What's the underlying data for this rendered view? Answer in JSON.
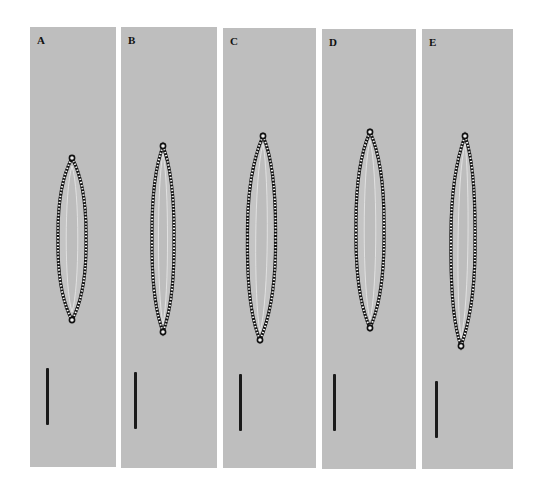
{
  "figure": {
    "background": "#ffffff",
    "panel_color": "#bebebe",
    "panels": [
      {
        "label": "A",
        "x": 30,
        "y": 27,
        "w": 86,
        "h": 440,
        "cell": {
          "cx_top": 72,
          "cx_bot": 72,
          "top": 158,
          "bottom": 320,
          "half_width": 14
        },
        "scalebar": {
          "x": 46,
          "y1": 368,
          "y2": 425
        }
      },
      {
        "label": "B",
        "x": 121,
        "y": 27,
        "w": 96,
        "h": 441,
        "cell": {
          "cx_top": 163,
          "cx_bot": 163,
          "top": 146,
          "bottom": 332,
          "half_width": 11
        },
        "scalebar": {
          "x": 134,
          "y1": 372,
          "y2": 429
        }
      },
      {
        "label": "C",
        "x": 223,
        "y": 28,
        "w": 93,
        "h": 440,
        "cell": {
          "cx_top": 263,
          "cx_bot": 260,
          "top": 136,
          "bottom": 340,
          "half_width": 14
        },
        "scalebar": {
          "x": 239,
          "y1": 374,
          "y2": 431
        }
      },
      {
        "label": "D",
        "x": 322,
        "y": 29,
        "w": 94,
        "h": 440,
        "cell": {
          "cx_top": 370,
          "cx_bot": 370,
          "top": 132,
          "bottom": 328,
          "half_width": 14
        },
        "scalebar": {
          "x": 333,
          "y1": 374,
          "y2": 431
        }
      },
      {
        "label": "E",
        "x": 422,
        "y": 29,
        "w": 91,
        "h": 440,
        "cell": {
          "cx_top": 465,
          "cx_bot": 461,
          "top": 136,
          "bottom": 346,
          "half_width": 12
        },
        "scalebar": {
          "x": 435,
          "y1": 381,
          "y2": 438
        }
      }
    ]
  }
}
